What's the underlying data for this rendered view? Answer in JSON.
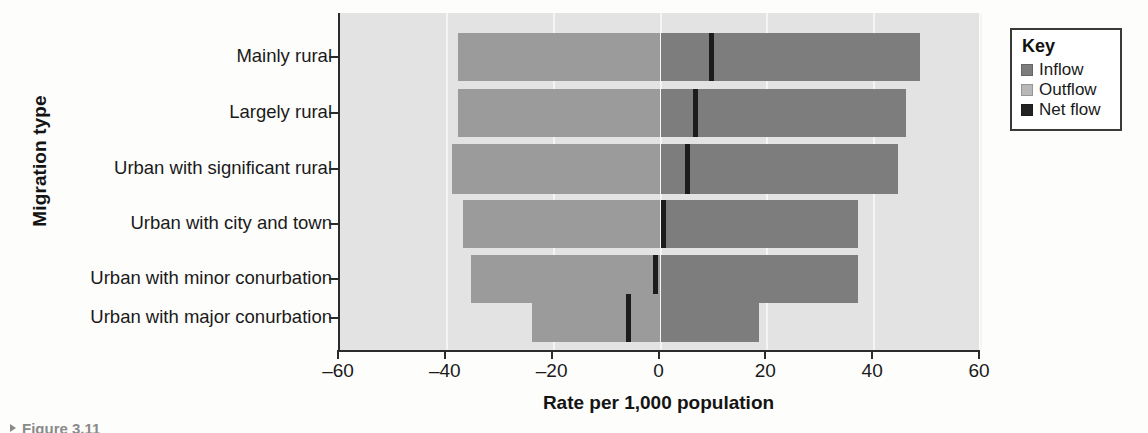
{
  "chart_data": {
    "type": "bar",
    "title": "",
    "xlabel": "Rate per 1,000 population",
    "ylabel": "Migration type",
    "xlim": [
      -60,
      60
    ],
    "xticks": [
      -60,
      -40,
      -20,
      0,
      20,
      40,
      60
    ],
    "xtick_labels": [
      "–60",
      "–40",
      "–20",
      "0",
      "20",
      "40",
      "60"
    ],
    "grid": true,
    "orientation": "horizontal",
    "legend": {
      "title": "Key",
      "position": "right-outside",
      "entries": [
        {
          "label": "Inflow",
          "color": "#7d7d7d"
        },
        {
          "label": "Outflow",
          "color": "#b8b8b8"
        },
        {
          "label": "Net flow",
          "color": "#232323"
        }
      ]
    },
    "categories": [
      "Mainly rural",
      "Largely rural",
      "Urban with significant rural",
      "Urban with city and town",
      "Urban with minor conurbation",
      "Urban with major conurbation"
    ],
    "series": [
      {
        "name": "Outflow",
        "values": [
          -38.0,
          -38.0,
          -39.0,
          -37.0,
          -35.5,
          -24.0
        ]
      },
      {
        "name": "Inflow",
        "values": [
          48.5,
          46.0,
          44.5,
          37.0,
          37.0,
          18.5
        ]
      },
      {
        "name": "Net flow",
        "values": [
          9.5,
          6.5,
          5.0,
          0.5,
          -1.0,
          -6.0
        ]
      }
    ]
  },
  "caption": {
    "fragment": "Figure 3.11"
  }
}
